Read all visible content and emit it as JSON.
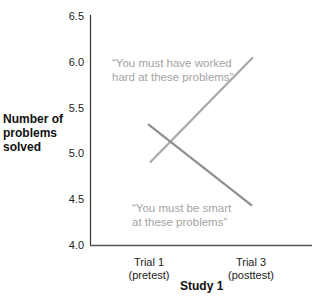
{
  "chart_data": {
    "type": "line",
    "title": "",
    "xlabel": "Study 1",
    "ylabel": "Number of problems solved",
    "categories": [
      "Trial 1 (pretest)",
      "Trial 3 (posttest)"
    ],
    "category_lines": [
      [
        "Trial 1",
        "(pretest)"
      ],
      [
        "Trial 3",
        "(posttest)"
      ]
    ],
    "ylim": [
      4.0,
      6.5
    ],
    "yticks": [
      "6.5",
      "6.0",
      "5.5",
      "5.0",
      "4.5",
      "4.0"
    ],
    "grid": false,
    "legend": "none (inline annotations)",
    "series": [
      {
        "name": "“You must have worked hard at these problems”",
        "annotation_lines": [
          "“You must have worked",
          "hard at these problems”"
        ],
        "values": [
          4.9,
          6.05
        ],
        "color": "#a8a8a8"
      },
      {
        "name": "“You must be smart at these problems”",
        "annotation_lines": [
          "“You must be smart",
          "at these problems”"
        ],
        "values": [
          5.32,
          4.43
        ],
        "color": "#8e8e8e"
      }
    ]
  },
  "ylabel_lines": [
    "Number of",
    "problems",
    "solved"
  ],
  "axis_color": "#333333"
}
